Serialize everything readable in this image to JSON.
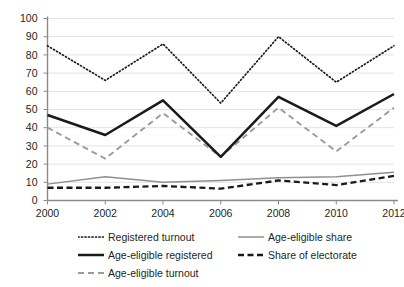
{
  "top_partial_text": "",
  "chart_data": {
    "type": "line",
    "title": "",
    "subtitle": "",
    "xlabel": "",
    "ylabel": "",
    "x": [
      2000,
      2002,
      2004,
      2006,
      2008,
      2010,
      2012
    ],
    "categories": [
      "2000",
      "2002",
      "2004",
      "2006",
      "2008",
      "2010",
      "2012"
    ],
    "ylim": [
      0,
      100
    ],
    "yticks": [
      0,
      10,
      20,
      30,
      40,
      50,
      60,
      70,
      80,
      90,
      100
    ],
    "ytick_labels": [
      "0",
      "10",
      "20",
      "30",
      "40",
      "50",
      "60",
      "70",
      "80",
      "90",
      "100"
    ],
    "grid": true,
    "grid_axis": "y",
    "legend_position": "bottom",
    "series": [
      {
        "name": "Registered turnout",
        "key": "registered-turnout",
        "style": "dotted",
        "color": "#1a1a1a",
        "values": [
          85,
          66,
          86,
          53.5,
          90,
          65,
          85
        ]
      },
      {
        "name": "Age-eligible registered",
        "key": "age-eligible-registered",
        "style": "solid-thick",
        "color": "#1a1a1a",
        "values": [
          47,
          36,
          55,
          24,
          57,
          41,
          58.5
        ]
      },
      {
        "name": "Age-eligible turnout",
        "key": "age-eligible-turnout",
        "style": "dashed",
        "color": "#9a9a9a",
        "values": [
          40,
          23,
          48,
          24,
          51,
          27,
          51
        ]
      },
      {
        "name": "Age-eligible share",
        "key": "age-eligible-share",
        "style": "solid-thin",
        "color": "#8f8f8f",
        "values": [
          9,
          13,
          10,
          11,
          12.5,
          13,
          15.5
        ]
      },
      {
        "name": "Share of electorate",
        "key": "share-of-electorate",
        "style": "dashed-thick",
        "color": "#1a1a1a",
        "values": [
          7,
          7,
          8,
          6.5,
          11,
          8.5,
          13.5
        ]
      }
    ]
  },
  "legend": {
    "columns": [
      [
        {
          "label": "Registered turnout",
          "key": "registered-turnout"
        },
        {
          "label": "Age-eligible registered",
          "key": "age-eligible-registered"
        },
        {
          "label": "Age-eligible turnout",
          "key": "age-eligible-turnout"
        }
      ],
      [
        {
          "label": "Age-eligible share",
          "key": "age-eligible-share"
        },
        {
          "label": "Share of electorate",
          "key": "share-of-electorate"
        }
      ]
    ]
  }
}
